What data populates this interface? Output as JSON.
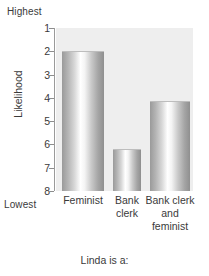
{
  "chart_data": {
    "type": "bar",
    "title": "",
    "xlabel": "Linda is a:",
    "ylabel": "Likelihood",
    "categories": [
      "Feminist",
      "Bank clerk",
      "Bank clerk and feminist"
    ],
    "values": [
      2.0,
      6.2,
      4.15
    ],
    "ylim": [
      8,
      1
    ],
    "y_inverted": true,
    "y_ticks": [
      "1",
      "2",
      "3",
      "4",
      "5",
      "6",
      "7",
      "8"
    ],
    "y_tick_values": [
      1,
      2,
      3,
      4,
      5,
      6,
      7,
      8
    ],
    "y_axis_top_annotation": "Highest",
    "y_axis_bottom_annotation": "Lowest",
    "grid": false,
    "legend": false,
    "plot_background": "#eeeeee",
    "bar_color_light": "#ffffff",
    "bar_color_dark": "#8f8f8f"
  },
  "axis": {
    "highest": "Highest",
    "lowest": "Lowest",
    "ylabel": "Likelihood",
    "xlabel": "Linda is a:"
  },
  "categories": [
    {
      "label": "Feminist",
      "lines": [
        "Feminist"
      ]
    },
    {
      "label": "Bank clerk",
      "lines": [
        "Bank",
        "clerk"
      ]
    },
    {
      "label": "Bank clerk and feminist",
      "lines": [
        "Bank clerk",
        "and",
        "feminist"
      ]
    }
  ],
  "ticks": [
    {
      "label": "1"
    },
    {
      "label": "2"
    },
    {
      "label": "3"
    },
    {
      "label": "4"
    },
    {
      "label": "5"
    },
    {
      "label": "6"
    },
    {
      "label": "7"
    },
    {
      "label": "8"
    }
  ]
}
